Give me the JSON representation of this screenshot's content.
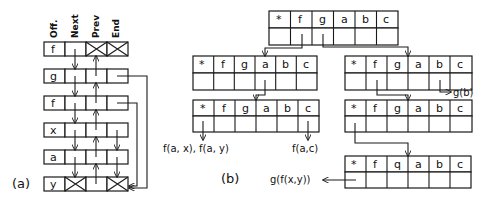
{
  "part_a": {
    "caption": "(a)",
    "column_headers": [
      "Off.",
      "Next",
      "Prev",
      "End"
    ],
    "rows": [
      {
        "off": "f",
        "next": "",
        "prev": "X",
        "end": "X"
      },
      {
        "off": "g",
        "next": "",
        "prev": "",
        "end": ""
      },
      {
        "off": "f",
        "next": "",
        "prev": "",
        "end": ""
      },
      {
        "off": "x",
        "next": "",
        "prev": "",
        "end": ""
      },
      {
        "off": "a",
        "next": "",
        "prev": "",
        "end": ""
      },
      {
        "off": "y",
        "next": "X",
        "prev": "",
        "end": "X"
      }
    ]
  },
  "part_b": {
    "caption": "(b)",
    "table_header": [
      "*",
      "f",
      "g",
      "a",
      "b",
      "c"
    ],
    "nodes": [
      {
        "id": "root",
        "header": [
          "*",
          "f",
          "g",
          "a",
          "b",
          "c"
        ]
      },
      {
        "id": "after-f",
        "header": [
          "*",
          "f",
          "g",
          "a",
          "b",
          "c"
        ]
      },
      {
        "id": "after-g",
        "header": [
          "*",
          "f",
          "g",
          "a",
          "b",
          "c"
        ]
      },
      {
        "id": "after-f-a",
        "header": [
          "*",
          "f",
          "g",
          "a",
          "b",
          "c"
        ]
      },
      {
        "id": "after-g-f",
        "header": [
          "*",
          "f",
          "g",
          "a",
          "b",
          "c"
        ]
      },
      {
        "id": "after-g-f-q",
        "header": [
          "*",
          "f",
          "q",
          "a",
          "b",
          "c"
        ]
      }
    ],
    "leaf_labels": {
      "g_b": "g(b)",
      "f_ax_f_ay": "f(a, x), f(a, y)",
      "f_ac": "f(a,c)",
      "g_fxy": "g(f(x,y))"
    }
  }
}
